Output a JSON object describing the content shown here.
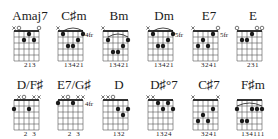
{
  "colors": {
    "ink": "#1a1a1a",
    "grid": "#555555",
    "background": "#ffffff"
  },
  "chords": [
    {
      "name": "Amaj7",
      "x": 8,
      "y": 0,
      "fret_label": "",
      "markers": [
        "x",
        "o",
        "",
        "",
        "",
        "o"
      ],
      "dots": [
        [
          3,
          2
        ],
        [
          4,
          1
        ],
        [
          5,
          2
        ]
      ],
      "barre": null,
      "fingering": "213"
    },
    {
      "name": "C♯m",
      "x": 52,
      "y": 0,
      "fret_label": "4fr",
      "markers": [
        "x",
        "",
        "",
        "",
        "",
        ""
      ],
      "dots": [
        [
          2,
          1
        ],
        [
          3,
          3
        ],
        [
          4,
          3
        ],
        [
          5,
          2
        ],
        [
          6,
          1
        ]
      ],
      "barre": [
        2,
        6,
        1
      ],
      "fingering": "13421"
    },
    {
      "name": "Bm",
      "x": 97,
      "y": 0,
      "fret_label": "",
      "markers": [
        "x",
        "",
        "",
        "",
        "",
        ""
      ],
      "dots": [
        [
          2,
          2
        ],
        [
          3,
          4
        ],
        [
          4,
          4
        ],
        [
          5,
          3
        ],
        [
          6,
          2
        ]
      ],
      "barre": [
        2,
        6,
        2
      ],
      "fingering": "13421"
    },
    {
      "name": "Dm",
      "x": 142,
      "y": 0,
      "fret_label": "5fr",
      "markers": [
        "x",
        "",
        "",
        "",
        "",
        ""
      ],
      "dots": [
        [
          2,
          1
        ],
        [
          3,
          3
        ],
        [
          4,
          3
        ],
        [
          5,
          2
        ],
        [
          6,
          1
        ]
      ],
      "barre": [
        2,
        6,
        1
      ],
      "fingering": "13421"
    },
    {
      "name": "E7",
      "x": 187,
      "y": 0,
      "fret_label": "5fr",
      "markers": [
        "x",
        "",
        "",
        "",
        "",
        "o"
      ],
      "dots": [
        [
          2,
          3
        ],
        [
          3,
          2
        ],
        [
          4,
          3
        ],
        [
          5,
          1
        ]
      ],
      "barre": null,
      "fingering": "3241"
    },
    {
      "name": "E",
      "x": 231,
      "y": 0,
      "fret_label": "",
      "markers": [
        "o",
        "",
        "",
        "",
        "o",
        "o"
      ],
      "dots": [
        [
          2,
          2
        ],
        [
          3,
          2
        ],
        [
          4,
          1
        ]
      ],
      "barre": null,
      "fingering": "231"
    },
    {
      "name": "D/F♯",
      "x": 8,
      "y": 69,
      "fret_label": "",
      "markers": [
        "",
        "x",
        "o",
        "",
        "x",
        "x"
      ],
      "dots": [
        [
          1,
          2
        ],
        [
          4,
          2
        ]
      ],
      "barre": null,
      "fingering": "2  3"
    },
    {
      "name": "E7/G♯",
      "x": 52,
      "y": 69,
      "fret_label": "4fr",
      "markers": [
        "",
        "x",
        "o",
        "",
        "x",
        "x"
      ],
      "dots": [
        [
          1,
          1
        ],
        [
          4,
          1
        ]
      ],
      "barre": null,
      "fingering": "2  3"
    },
    {
      "name": "D",
      "x": 97,
      "y": 69,
      "fret_label": "",
      "markers": [
        "x",
        "x",
        "o",
        "",
        "",
        ""
      ],
      "dots": [
        [
          4,
          2
        ],
        [
          5,
          3
        ],
        [
          6,
          2
        ]
      ],
      "barre": null,
      "fingering": "132"
    },
    {
      "name": "D♯°7",
      "x": 142,
      "y": 69,
      "fret_label": "",
      "markers": [
        "x",
        "x",
        "",
        "",
        "",
        ""
      ],
      "dots": [
        [
          3,
          1
        ],
        [
          4,
          2
        ],
        [
          5,
          1
        ],
        [
          6,
          2
        ]
      ],
      "barre": null,
      "fingering": "1324"
    },
    {
      "name": "C♯7",
      "x": 187,
      "y": 69,
      "fret_label": "",
      "markers": [
        "x",
        "",
        "",
        "",
        "",
        "x"
      ],
      "dots": [
        [
          2,
          4
        ],
        [
          3,
          3
        ],
        [
          4,
          4
        ],
        [
          5,
          2
        ]
      ],
      "barre": null,
      "fingering": "3241"
    },
    {
      "name": "F♯m",
      "x": 231,
      "y": 69,
      "fret_label": "",
      "markers": [
        "",
        "",
        "",
        "",
        "",
        ""
      ],
      "dots": [
        [
          1,
          2
        ],
        [
          2,
          4
        ],
        [
          3,
          4
        ],
        [
          4,
          2
        ],
        [
          5,
          2
        ],
        [
          6,
          2
        ]
      ],
      "barre": [
        1,
        6,
        2
      ],
      "fingering": "134111"
    }
  ]
}
